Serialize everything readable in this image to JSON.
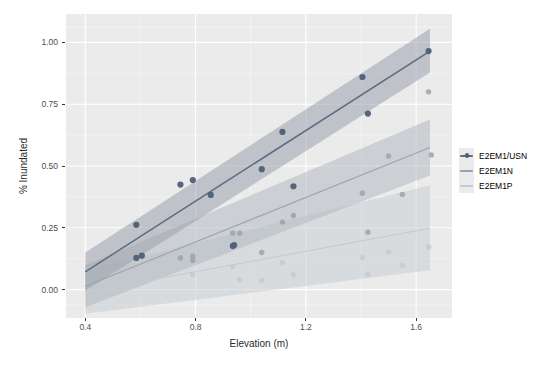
{
  "chart_data": {
    "type": "scatter",
    "title": "",
    "subtitle": "",
    "xlabel": "Elevation (m)",
    "ylabel": "% Inundated",
    "xlim": [
      0.33,
      1.73
    ],
    "ylim": [
      -0.115,
      1.115
    ],
    "xticks": [
      "0.4",
      "0.8",
      "1.2",
      "1.6"
    ],
    "xtick_values": [
      0.4,
      0.8,
      1.2,
      1.6
    ],
    "yticks": [
      "0.00",
      "0.25",
      "0.50",
      "0.75",
      "1.00"
    ],
    "ytick_values": [
      0.0,
      0.25,
      0.5,
      0.75,
      1.0
    ],
    "grid": true,
    "grid_major_color": "#ffffff",
    "grid_minor_color": "#f5f5f5",
    "panel_background": "#ebebeb",
    "legend_position": "right",
    "legend_title": "",
    "series": [
      {
        "name": "E2EM1/USN",
        "color": "#5a6b84",
        "band_color": "#9aa3ad",
        "point_color": "#4e5f78",
        "fit_x": [
          0.4,
          1.65
        ],
        "fit_y": [
          0.072,
          0.965
        ],
        "band_upper": [
          0.15,
          1.055
        ],
        "band_lower": [
          -0.005,
          0.878
        ],
        "points": [
          {
            "x": 0.585,
            "y": 0.262
          },
          {
            "x": 0.585,
            "y": 0.128
          },
          {
            "x": 0.605,
            "y": 0.137
          },
          {
            "x": 0.745,
            "y": 0.425
          },
          {
            "x": 0.79,
            "y": 0.443
          },
          {
            "x": 0.855,
            "y": 0.383
          },
          {
            "x": 0.935,
            "y": 0.176
          },
          {
            "x": 0.94,
            "y": 0.18
          },
          {
            "x": 1.04,
            "y": 0.487
          },
          {
            "x": 1.115,
            "y": 0.638
          },
          {
            "x": 1.155,
            "y": 0.418
          },
          {
            "x": 1.405,
            "y": 0.86
          },
          {
            "x": 1.425,
            "y": 0.712
          },
          {
            "x": 1.645,
            "y": 0.965
          }
        ]
      },
      {
        "name": "E2EM1N",
        "color": "#9aa3ad",
        "band_color": "#b2b8bf",
        "point_color": "#9aa3ad",
        "fit_x": [
          0.4,
          1.65
        ],
        "fit_y": [
          0.013,
          0.575
        ],
        "band_upper": [
          0.098,
          0.688
        ],
        "band_lower": [
          -0.072,
          0.462
        ],
        "points": [
          {
            "x": 0.745,
            "y": 0.128
          },
          {
            "x": 0.79,
            "y": 0.135
          },
          {
            "x": 0.79,
            "y": 0.118
          },
          {
            "x": 0.935,
            "y": 0.228
          },
          {
            "x": 0.96,
            "y": 0.228
          },
          {
            "x": 1.04,
            "y": 0.15
          },
          {
            "x": 1.115,
            "y": 0.273
          },
          {
            "x": 1.155,
            "y": 0.3
          },
          {
            "x": 1.405,
            "y": 0.39
          },
          {
            "x": 1.425,
            "y": 0.232
          },
          {
            "x": 1.5,
            "y": 0.54
          },
          {
            "x": 1.55,
            "y": 0.385
          },
          {
            "x": 1.645,
            "y": 0.8
          },
          {
            "x": 1.655,
            "y": 0.545
          }
        ]
      },
      {
        "name": "E2EM1P",
        "color": "#c4cad1",
        "band_color": "#c9ced4",
        "point_color": "#c4cad1",
        "fit_x": [
          0.4,
          1.65
        ],
        "fit_y": [
          -0.01,
          0.248
        ],
        "band_upper": [
          0.078,
          0.422
        ],
        "band_lower": [
          -0.098,
          0.078
        ],
        "points": [
          {
            "x": 0.79,
            "y": 0.06
          },
          {
            "x": 0.935,
            "y": 0.093
          },
          {
            "x": 0.96,
            "y": 0.04
          },
          {
            "x": 1.04,
            "y": 0.038
          },
          {
            "x": 1.115,
            "y": 0.11
          },
          {
            "x": 1.155,
            "y": 0.06
          },
          {
            "x": 1.405,
            "y": 0.13
          },
          {
            "x": 1.425,
            "y": 0.062
          },
          {
            "x": 1.5,
            "y": 0.152
          },
          {
            "x": 1.55,
            "y": 0.098
          },
          {
            "x": 1.645,
            "y": 0.172
          }
        ]
      }
    ]
  },
  "legend": {
    "items": [
      {
        "label": "E2EM1/USN"
      },
      {
        "label": "E2EM1N"
      },
      {
        "label": "E2EM1P"
      }
    ]
  },
  "axes": {
    "x_title": "Elevation (m)",
    "y_title": "% Inundated"
  }
}
